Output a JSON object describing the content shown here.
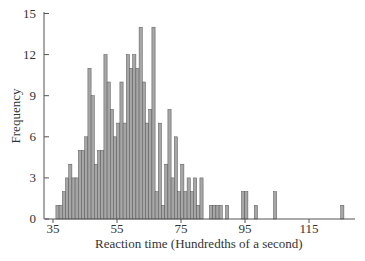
{
  "chart_data": {
    "type": "bar",
    "title": "",
    "xlabel": "Reaction time (Hundredths of a second)",
    "ylabel": "Frequency",
    "xlim": [
      35,
      127
    ],
    "ylim": [
      0,
      15
    ],
    "x_ticks": [
      35,
      55,
      75,
      95,
      115
    ],
    "y_ticks": [
      0,
      3,
      6,
      9,
      12,
      15
    ],
    "grid": false,
    "legend": null,
    "bar_color": "#a6a6a6",
    "bar_edge_color": "#555555",
    "x": [
      36,
      37,
      38,
      39,
      40,
      41,
      42,
      43,
      44,
      45,
      46,
      47,
      48,
      49,
      50,
      51,
      52,
      53,
      54,
      55,
      56,
      57,
      58,
      59,
      60,
      61,
      62,
      63,
      64,
      65,
      66,
      67,
      68,
      69,
      70,
      71,
      72,
      73,
      74,
      75,
      76,
      77,
      78,
      79,
      80,
      81,
      82,
      83,
      84,
      85,
      86,
      87,
      88,
      89,
      90,
      91,
      92,
      93,
      94,
      95,
      96,
      97,
      98,
      99,
      100,
      101,
      102,
      103,
      104,
      105,
      106,
      107,
      108,
      109,
      110,
      111,
      112,
      113,
      114,
      115,
      116,
      117,
      118,
      119,
      120,
      121,
      122,
      123,
      124,
      125
    ],
    "values": [
      1,
      1,
      2,
      3,
      4,
      3,
      3,
      5,
      5,
      6,
      11,
      9,
      4,
      5,
      5,
      12,
      10,
      8,
      6,
      7,
      10,
      7,
      12,
      11,
      12,
      11,
      14,
      10,
      7,
      8,
      14,
      2,
      7,
      1,
      4,
      8,
      3,
      6,
      2,
      4,
      2,
      3,
      2,
      3,
      1,
      3,
      0,
      0,
      1,
      1,
      1,
      1,
      0,
      1,
      0,
      0,
      0,
      0,
      2,
      2,
      0,
      0,
      1,
      0,
      0,
      0,
      0,
      0,
      2,
      0,
      0,
      0,
      0,
      0,
      0,
      0,
      0,
      0,
      0,
      0,
      0,
      0,
      0,
      0,
      0,
      0,
      0,
      0,
      0,
      1
    ]
  },
  "labels": {
    "xlabel": "Reaction time (Hundredths of a second)",
    "ylabel": "Frequency"
  }
}
